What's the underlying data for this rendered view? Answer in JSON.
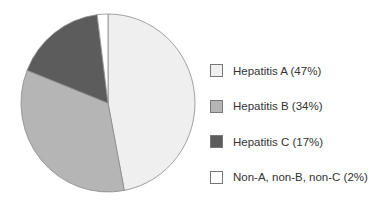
{
  "chart_data": {
    "type": "pie",
    "title": "",
    "start_angle_deg": 0,
    "direction": "clockwise",
    "slices": [
      {
        "label": "Hepatitis A",
        "value": 47,
        "color": "#efefef",
        "legend": "Hepatitis A (47%)"
      },
      {
        "label": "Hepatitis B",
        "value": 34,
        "color": "#b5b5b5",
        "legend": "Hepatitis B (34%)"
      },
      {
        "label": "Hepatitis C",
        "value": 17,
        "color": "#5c5c5c",
        "legend": "Hepatitis C (17%)"
      },
      {
        "label": "Non-A, non-B, non-C",
        "value": 2,
        "color": "#ffffff",
        "legend": "Non-A, non-B, non-C (2%)"
      }
    ],
    "legend_position": "right"
  }
}
